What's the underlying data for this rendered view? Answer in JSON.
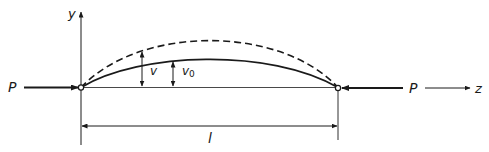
{
  "diagram": {
    "labels": {
      "y_axis": "y",
      "z_axis": "z",
      "load_left": "P",
      "load_right": "P",
      "deflection": "v",
      "initial_deflection": "v",
      "initial_deflection_sub": "0",
      "length": "l"
    },
    "curves": [
      {
        "name": "initial-shape",
        "style": "solid",
        "description": "initially curved column axis, amplitude v0"
      },
      {
        "name": "deflected-shape",
        "style": "dashed",
        "description": "deflected shape under load P, total deflection v"
      }
    ],
    "supports": [
      {
        "name": "left-pin",
        "type": "pin"
      },
      {
        "name": "right-pin",
        "type": "pin"
      }
    ],
    "colors": {
      "ink": "#1a1a1a",
      "background": "#ffffff"
    }
  }
}
